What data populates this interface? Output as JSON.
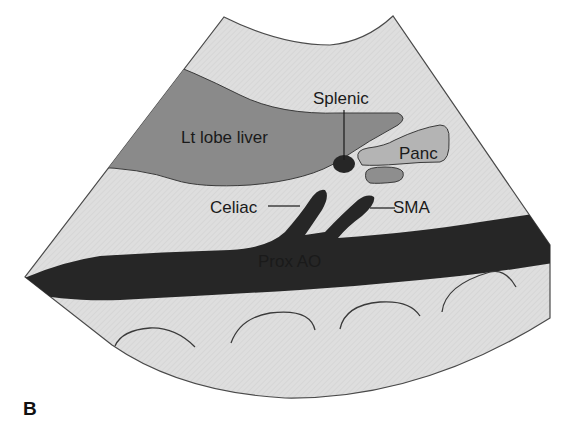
{
  "figure": {
    "panel_label": "B",
    "labels": {
      "liver": "Lt lobe liver",
      "splenic": "Splenic",
      "pancreas": "Panc",
      "celiac": "Celiac",
      "sma": "SMA",
      "aorta": "Prox AO"
    },
    "colors": {
      "background": "#ffffff",
      "fan_fill": "#dedede",
      "fan_outline": "#4a4a4a",
      "liver_fill": "#8a8a8a",
      "pancreas_fill": "#b4b4b4",
      "pancreas_lower_fill": "#8e8e8e",
      "vessel_fill": "#262626",
      "text": "#1a1a1a"
    }
  }
}
